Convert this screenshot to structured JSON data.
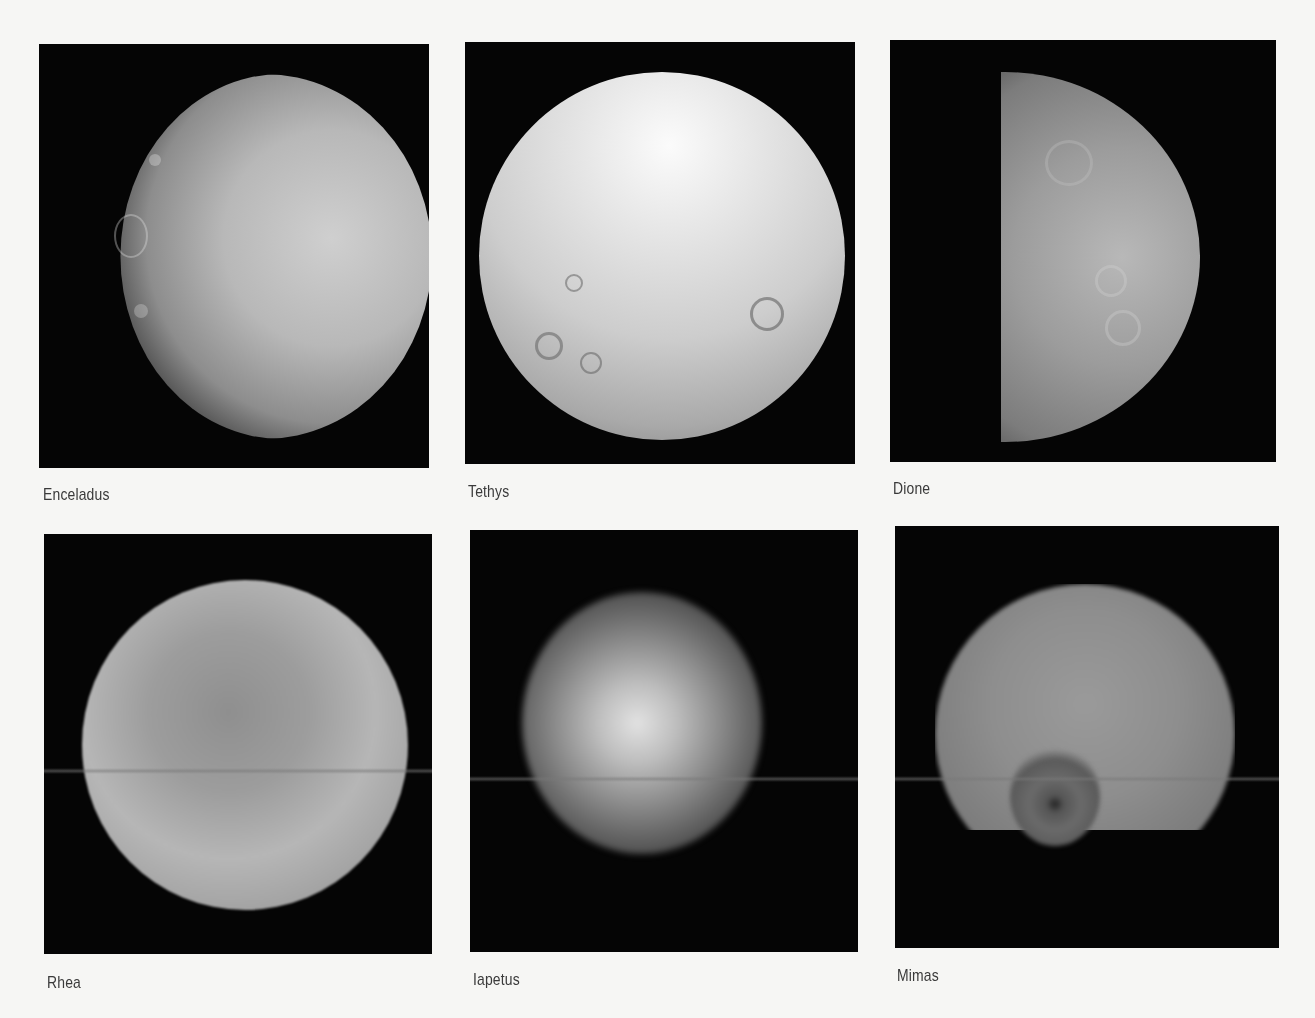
{
  "page": {
    "background": "#f6f6f4",
    "panel_background": "#050505"
  },
  "panels": [
    {
      "id": "enceladus",
      "caption": "Enceladus",
      "row": 1,
      "column": 1,
      "description": "Half-lit moon with cratered left limb and grooved terrain on right"
    },
    {
      "id": "tethys",
      "caption": "Tethys",
      "row": 1,
      "column": 2,
      "description": "Nearly full bright cratered moon"
    },
    {
      "id": "dione",
      "caption": "Dione",
      "row": 1,
      "column": 3,
      "description": "Gibbous moon lit from right, cratered terminator"
    },
    {
      "id": "rhea",
      "caption": "Rhea",
      "row": 2,
      "column": 1,
      "description": "Blurry full disk with bright streaks"
    },
    {
      "id": "iapetus",
      "caption": "Iapetus",
      "row": 2,
      "column": 2,
      "description": "Partially lit blurry disk, dark region on left"
    },
    {
      "id": "mimas",
      "caption": "Mimas",
      "row": 2,
      "column": 3,
      "description": "Blurry disk with large crater near lower limb"
    }
  ]
}
